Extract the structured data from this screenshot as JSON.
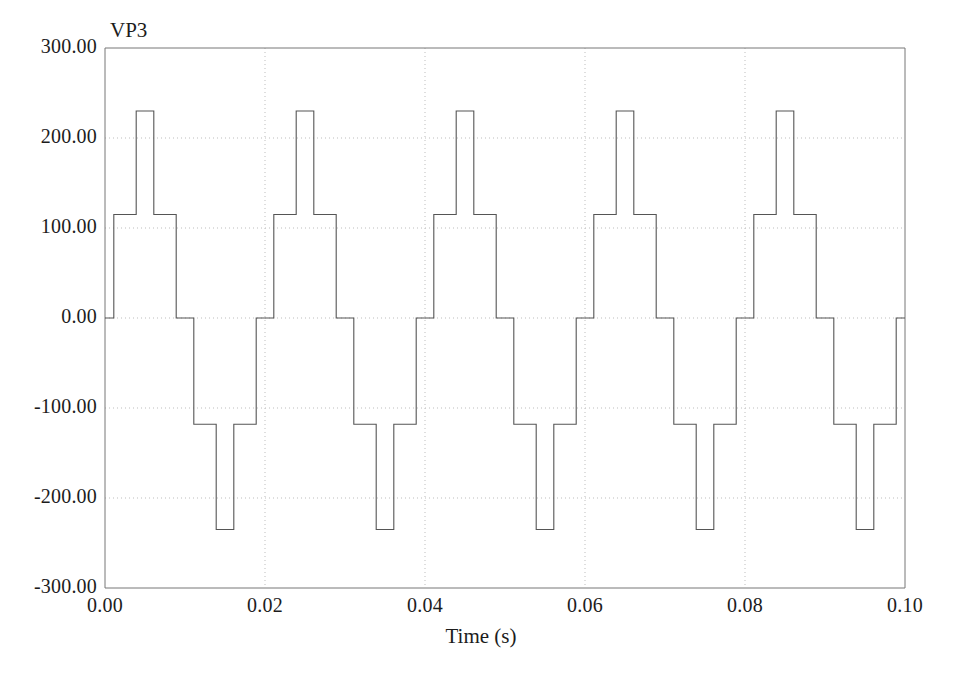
{
  "chart_data": {
    "type": "line",
    "title": "",
    "series_label": "VP3",
    "xlabel": "Time (s)",
    "ylabel": "",
    "xlim": [
      0.0,
      0.1
    ],
    "ylim": [
      -300.0,
      300.0
    ],
    "xticks": [
      "0.00",
      "0.02",
      "0.04",
      "0.06",
      "0.08",
      "0.10"
    ],
    "xtick_values": [
      0.0,
      0.02,
      0.04,
      0.06,
      0.08,
      0.1
    ],
    "yticks": [
      "300.00",
      "200.00",
      "100.00",
      "0.00",
      "-100.00",
      "-200.00",
      "-300.00"
    ],
    "ytick_values": [
      300,
      200,
      100,
      0,
      -100,
      -200,
      -300
    ],
    "grid": true,
    "grid_style": "dotted",
    "legend": "none",
    "line_color": "#555555",
    "grid_color": "#bdbdbd",
    "axis_color": "#777777",
    "background": "#ffffff",
    "waveform_description": "Five-level staircase inverter phase voltage, 50 Hz, levels 0 / +-115 / +-230 V",
    "period_s": 0.02,
    "levels": [
      0,
      115,
      230,
      -118,
      -235
    ],
    "series": [
      {
        "name": "VP3",
        "step_points": [
          [
            0.0,
            0
          ],
          [
            0.0011,
            115
          ],
          [
            0.0039,
            230
          ],
          [
            0.0061,
            115
          ],
          [
            0.0089,
            0
          ],
          [
            0.0111,
            -118
          ],
          [
            0.0139,
            -235
          ],
          [
            0.0161,
            -118
          ],
          [
            0.0189,
            0
          ],
          [
            0.0211,
            115
          ],
          [
            0.0239,
            230
          ],
          [
            0.0261,
            115
          ],
          [
            0.0289,
            0
          ],
          [
            0.0311,
            -118
          ],
          [
            0.0339,
            -235
          ],
          [
            0.0361,
            -118
          ],
          [
            0.0389,
            0
          ],
          [
            0.0411,
            115
          ],
          [
            0.0439,
            230
          ],
          [
            0.0461,
            115
          ],
          [
            0.0489,
            0
          ],
          [
            0.0511,
            -118
          ],
          [
            0.0539,
            -235
          ],
          [
            0.0561,
            -118
          ],
          [
            0.0589,
            0
          ],
          [
            0.0611,
            115
          ],
          [
            0.0639,
            230
          ],
          [
            0.0661,
            115
          ],
          [
            0.0689,
            0
          ],
          [
            0.0711,
            -118
          ],
          [
            0.0739,
            -235
          ],
          [
            0.0761,
            -118
          ],
          [
            0.0789,
            0
          ],
          [
            0.0811,
            115
          ],
          [
            0.0839,
            230
          ],
          [
            0.0861,
            115
          ],
          [
            0.0889,
            0
          ],
          [
            0.0911,
            -118
          ],
          [
            0.0939,
            -235
          ],
          [
            0.0961,
            -118
          ],
          [
            0.0989,
            0
          ],
          [
            0.1,
            0
          ]
        ]
      }
    ]
  }
}
